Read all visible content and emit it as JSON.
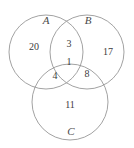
{
  "figure": {
    "type": "venn-diagram-3-set",
    "background_color": "#ffffff",
    "stroke_color": "#8a8a8a",
    "text_color": "#3c3c3c",
    "label_color": "#4a4a4a"
  },
  "sets": [
    {
      "id": "A",
      "label": "A",
      "label_x": 46,
      "label_y": 20,
      "cx": 46,
      "cy": 52,
      "r": 37
    },
    {
      "id": "B",
      "label": "B",
      "label_x": 88,
      "label_y": 20,
      "cx": 87,
      "cy": 52,
      "r": 37
    },
    {
      "id": "C",
      "label": "C",
      "label_x": 71,
      "label_y": 131,
      "cx": 70,
      "cy": 102,
      "r": 38
    }
  ],
  "regions": [
    {
      "id": "A-only",
      "value": "20",
      "x": 34,
      "y": 47
    },
    {
      "id": "A-and-B",
      "value": "3",
      "x": 69,
      "y": 44
    },
    {
      "id": "B-only",
      "value": "17",
      "x": 108,
      "y": 52
    },
    {
      "id": "A-B-C",
      "value": "1",
      "x": 69,
      "y": 62
    },
    {
      "id": "A-and-C",
      "value": "4",
      "x": 55,
      "y": 76
    },
    {
      "id": "B-and-C",
      "value": "8",
      "x": 87,
      "y": 74
    },
    {
      "id": "C-only",
      "value": "11",
      "x": 70,
      "y": 105
    }
  ]
}
